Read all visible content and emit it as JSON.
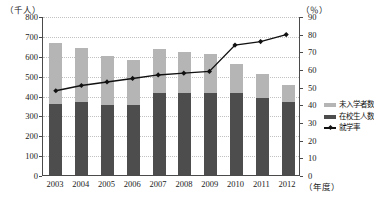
{
  "axes": {
    "left_unit": "（千人）",
    "right_unit": "（％）",
    "x_unit": "（年度）",
    "left_ticks": [
      "800",
      "700",
      "600",
      "500",
      "400",
      "300",
      "200",
      "100",
      "0"
    ],
    "right_ticks": [
      "90",
      "80",
      "70",
      "60",
      "50",
      "40",
      "30",
      "20",
      "10",
      "0"
    ]
  },
  "legend": {
    "items": [
      {
        "label": "未入学者数",
        "color": "#b5b5b5",
        "type": "swatch"
      },
      {
        "label": "在校生人数",
        "color": "#4d4d4d",
        "type": "swatch"
      },
      {
        "label": "就学率",
        "color": "#111111",
        "type": "line"
      }
    ]
  },
  "chart_data": {
    "type": "bar",
    "title": "",
    "subtitle": "",
    "xlabel": "（年度）",
    "ylabel": "（千人）",
    "y2label": "（％）",
    "ylim": [
      0,
      800
    ],
    "y2lim": [
      0,
      90
    ],
    "ytick_step": 100,
    "y2tick_step": 10,
    "grid": true,
    "legend_position": "right",
    "categories": [
      "2003",
      "2004",
      "2005",
      "2006",
      "2007",
      "2008",
      "2009",
      "2010",
      "2011",
      "2012"
    ],
    "series": [
      {
        "name": "在校生人数",
        "stack": "total",
        "axis": "left",
        "unit": "千人",
        "color": "#4d4d4d",
        "values": [
          355,
          365,
          350,
          350,
          415,
          415,
          415,
          415,
          385,
          365
        ]
      },
      {
        "name": "未入学者数",
        "stack": "total",
        "axis": "left",
        "unit": "千人",
        "color": "#b5b5b5",
        "values": [
          310,
          273,
          250,
          228,
          220,
          205,
          195,
          145,
          125,
          90
        ]
      },
      {
        "name": "就学率",
        "type": "line",
        "axis": "right",
        "unit": "％",
        "color": "#111111",
        "marker": "diamond",
        "values": [
          48,
          51,
          53,
          55,
          57,
          58,
          59,
          74,
          76,
          80
        ]
      }
    ],
    "bar_totals": [
      665,
      638,
      600,
      578,
      635,
      620,
      610,
      560,
      510,
      455
    ]
  }
}
